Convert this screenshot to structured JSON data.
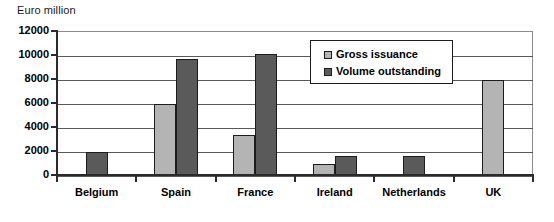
{
  "chart_data": {
    "type": "bar",
    "title": "",
    "ylabel": "Euro million",
    "xlabel": "",
    "ylim": [
      0,
      12000
    ],
    "ytick_values": [
      0,
      2000,
      4000,
      6000,
      8000,
      10000,
      12000
    ],
    "ytick_labels": [
      "0",
      "2000",
      "4000",
      "6000",
      "8000",
      "10000",
      "12000"
    ],
    "grid": true,
    "grid_axis": "y",
    "legend_position": "upper center-right",
    "categories": [
      "Belgium",
      "Spain",
      "France",
      "Ireland",
      "Netherlands",
      "UK"
    ],
    "series": [
      {
        "name": "Gross issuance",
        "color": "#b4b4b4",
        "values": [
          0,
          5900,
          3300,
          900,
          0,
          7900
        ]
      },
      {
        "name": "Volume outstanding",
        "color": "#5a5a5a",
        "values": [
          1900,
          9700,
          10100,
          1550,
          1600,
          0
        ]
      }
    ]
  },
  "legend": {
    "items": [
      {
        "label": "Gross issuance",
        "swatch": "legend-swatch-gross-issuance"
      },
      {
        "label": "Volume outstanding",
        "swatch": "legend-swatch-volume-outstanding"
      }
    ]
  },
  "colors": {
    "gross_issuance": "#b4b4b4",
    "volume_outstanding": "#5a5a5a",
    "axis": "#2b2b2b",
    "gridline": "#585858",
    "background": "#ffffff"
  }
}
